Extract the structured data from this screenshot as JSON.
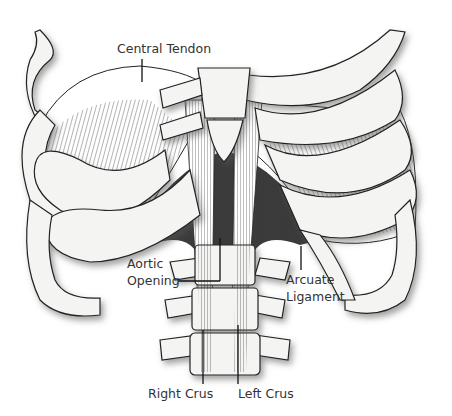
{
  "diagram": {
    "labels": {
      "central_tendon": "Central Tendon",
      "aortic_opening_line1": "Aortic",
      "aortic_opening_line2": "Opening",
      "arcuate_ligament_line1": "Arcuate",
      "arcuate_ligament_line2": "Ligament",
      "right_crus": "Right Crus",
      "left_crus": "Left Crus"
    },
    "colors": {
      "bone": "#f4f4f2",
      "outline": "#222222",
      "muscle_dark": "#3a3a3a",
      "shadow": "#9a9a9a",
      "label_text": "#333333"
    }
  }
}
